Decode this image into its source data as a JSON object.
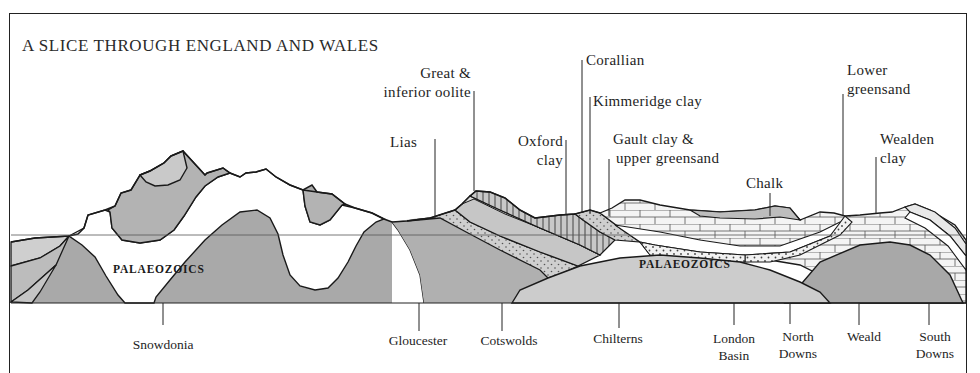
{
  "title": "A SLICE THROUGH ENGLAND AND WALES",
  "colors": {
    "outline": "#1a1a1a",
    "dark_grey": "#a7a7a7",
    "mid_grey": "#bdbdbd",
    "light_grey": "#d3d3d3",
    "white_band": "#ffffff",
    "frame": "#222222"
  },
  "strata_labels": [
    {
      "id": "lias",
      "text": "Lias"
    },
    {
      "id": "oolite",
      "line1": "Great &",
      "line2": "inferior oolite"
    },
    {
      "id": "oxford",
      "line1": "Oxford",
      "line2": "clay"
    },
    {
      "id": "corallian",
      "text": "Corallian"
    },
    {
      "id": "kimmeridge",
      "text": "Kimmeridge clay"
    },
    {
      "id": "gault",
      "line1": "Gault clay &",
      "line2": "upper greensand"
    },
    {
      "id": "chalk",
      "text": "Chalk"
    },
    {
      "id": "lower_greensand",
      "line1": "Lower",
      "line2": "greensand"
    },
    {
      "id": "wealden",
      "line1": "Wealden",
      "line2": "clay"
    }
  ],
  "rock_labels": [
    {
      "id": "palaeozoics_west",
      "text": "PALAEOZOICS"
    },
    {
      "id": "palaeozoics_east",
      "text": "PALAEOZOICS"
    }
  ],
  "places": [
    {
      "id": "snowdonia",
      "line1": "Snowdonia",
      "line2": ""
    },
    {
      "id": "gloucester",
      "line1": "Gloucester",
      "line2": ""
    },
    {
      "id": "cotswolds",
      "line1": "Cotswolds",
      "line2": ""
    },
    {
      "id": "chilterns",
      "line1": "Chilterns",
      "line2": ""
    },
    {
      "id": "london_basin",
      "line1": "London",
      "line2": "Basin"
    },
    {
      "id": "north_downs",
      "line1": "North",
      "line2": "Downs"
    },
    {
      "id": "weald",
      "line1": "Weald",
      "line2": ""
    },
    {
      "id": "south_downs",
      "line1": "South",
      "line2": "Downs"
    }
  ]
}
